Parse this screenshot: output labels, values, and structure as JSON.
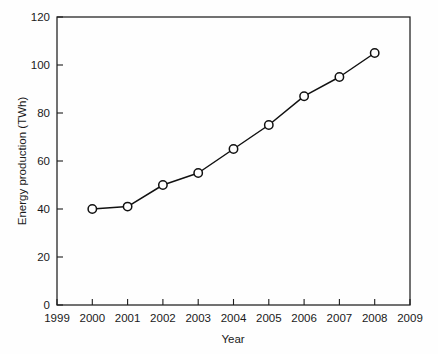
{
  "chart_data": {
    "type": "line",
    "title": "",
    "subtitle": "",
    "xlabel": "Year",
    "ylabel": "Energy production (TWh)",
    "x": [
      2000,
      2001,
      2002,
      2003,
      2004,
      2005,
      2006,
      2007,
      2008
    ],
    "values": [
      40,
      41,
      50,
      55,
      65,
      75,
      87,
      95,
      105
    ],
    "series": [
      {
        "name": "Energy production",
        "values": [
          40,
          41,
          50,
          55,
          65,
          75,
          87,
          95,
          105
        ]
      }
    ],
    "xlim": [
      1999,
      2009
    ],
    "ylim": [
      0,
      120
    ],
    "xticks": [
      1999,
      2000,
      2001,
      2002,
      2003,
      2004,
      2005,
      2006,
      2007,
      2008,
      2009
    ],
    "xtick_labels": [
      "1999",
      "2000",
      "2001",
      "2002",
      "2003",
      "2004",
      "2005",
      "2006",
      "2007",
      "2008",
      "2009"
    ],
    "yticks": [
      0,
      20,
      40,
      60,
      80,
      100,
      120
    ],
    "ytick_labels": [
      "0",
      "20",
      "40",
      "60",
      "80",
      "100",
      "120"
    ],
    "grid": false,
    "legend": null,
    "legend_position": "none",
    "marker": "open-circle",
    "line_color": "#111111",
    "marker_fill": "#fefefe",
    "background_color": "#fefefe",
    "axis_color": "#1d1d1d",
    "annotations": []
  },
  "axes": {
    "x_axis_title": "Year",
    "y_axis_title": "Energy production (TWh)"
  }
}
